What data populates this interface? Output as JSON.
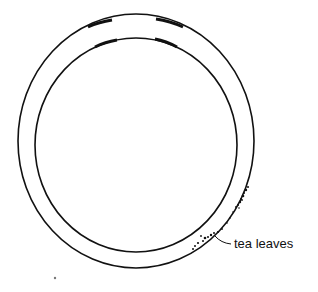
{
  "diagram": {
    "labels": {
      "tea_leaves": "tea leaves"
    },
    "colors": {
      "line": "#111111",
      "background": "#ffffff"
    }
  }
}
